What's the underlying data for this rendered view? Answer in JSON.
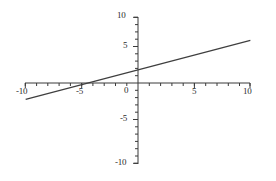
{
  "chart_data": {
    "type": "line",
    "title": "",
    "subtitle": "",
    "xlabel": "",
    "ylabel": "",
    "xlim": [
      -10,
      10
    ],
    "ylim": [
      -10,
      10
    ],
    "grid": false,
    "legend": null,
    "axis_color": "#3a3a3a",
    "line_color": "#3f3f3f",
    "background_color": "#ffffff",
    "x_ticks": [
      -10,
      -5,
      0,
      5,
      10
    ],
    "x_tick_labels": [
      "-10",
      "-5",
      "0",
      "5",
      "10"
    ],
    "y_ticks": [
      -10,
      -5,
      0,
      5,
      10
    ],
    "y_tick_labels": [
      "-10",
      "-5",
      "0",
      "5",
      "10"
    ],
    "minor_tick_interval": 1,
    "series": [
      {
        "name": "line",
        "equation": "y = 0.45x + 2",
        "slope": 0.45,
        "intercept": 2,
        "x_intercept": -4.4,
        "x": [
          -10,
          10
        ],
        "values": [
          -2.5,
          6.5
        ],
        "points": [
          {
            "x": -10,
            "y": -2.5
          },
          {
            "x": -5,
            "y": -0.25
          },
          {
            "x": -4.4,
            "y": 0
          },
          {
            "x": 0,
            "y": 2
          },
          {
            "x": 5,
            "y": 4.25
          },
          {
            "x": 10,
            "y": 6.5
          }
        ]
      }
    ]
  },
  "axis_labels": {
    "y_top": "10",
    "y_upper_mid": "5",
    "origin": "0",
    "y_lower_mid": "-5",
    "y_bottom": "-10",
    "x_left": "-10",
    "x_left_mid": "-5",
    "x_right_mid": "5",
    "x_right": "10"
  }
}
